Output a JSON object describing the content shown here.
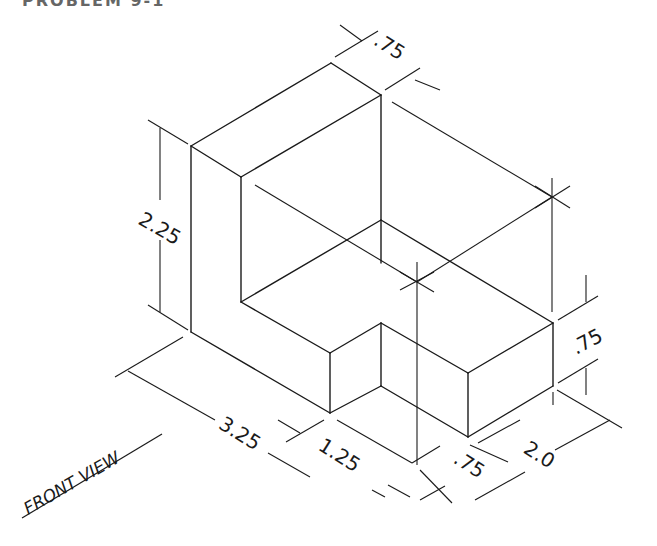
{
  "title": "PROBLEM 9-1",
  "diagram": {
    "type": "isometric-technical-drawing",
    "object": "L-shaped block with notch",
    "view_label": "FRONT VIEW",
    "line_color": "#1a1a1a",
    "background": "#ffffff",
    "dimensions": [
      {
        "id": "top-depth",
        "label": ".75"
      },
      {
        "id": "height",
        "label": "2.25"
      },
      {
        "id": "step-height",
        "label": ".75"
      },
      {
        "id": "length",
        "label": "3.25"
      },
      {
        "id": "notch-length",
        "label": "1.25"
      },
      {
        "id": "notch-width",
        "label": ".75"
      },
      {
        "id": "width",
        "label": "2.0"
      }
    ]
  }
}
